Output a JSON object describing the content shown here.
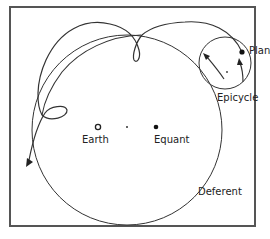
{
  "figure": {
    "labels": {
      "planet": "Planet",
      "epicycle": "Epicycle",
      "earth": "Earth",
      "equant": "Equant",
      "deferent": "Deferent"
    },
    "colors": {
      "line": "#333333",
      "frame": "#555555",
      "background": "#ffffff"
    },
    "elements": {
      "deferent_circle": {
        "cx": 127,
        "cy": 128,
        "r": 96
      },
      "epicycle_circle": {
        "cx": 224,
        "cy": 63,
        "r": 26
      },
      "planet_point": {
        "x": 242,
        "y": 52
      },
      "earth_point": {
        "x": 98,
        "y": 127
      },
      "center_point": {
        "x": 127,
        "y": 127
      },
      "equant_point": {
        "x": 156,
        "y": 127
      }
    }
  }
}
